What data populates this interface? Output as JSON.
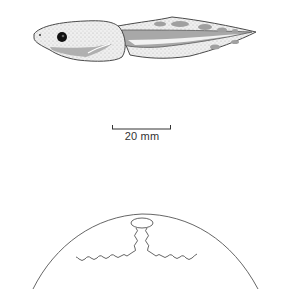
{
  "figure": {
    "subjects": [
      {
        "name": "tadpole",
        "view": "lateral"
      },
      {
        "name": "egg-or-embryo-dorsal-view",
        "view": "dorsal"
      }
    ],
    "scale_bar": {
      "label": "20 mm"
    },
    "colors": {
      "outline": "#4a4a4a",
      "shading": "#a8a8a8",
      "light": "#e8e8e8",
      "eye": "#111111"
    }
  }
}
